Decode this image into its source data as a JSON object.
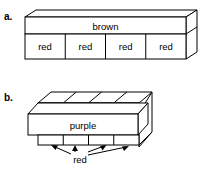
{
  "figure": {
    "background_color": "#ffffff",
    "stroke_color": "#000000",
    "text_color": "#000000",
    "panels": [
      {
        "id": "a",
        "label": "a.",
        "top_face_label": "brown",
        "front_cells": [
          {
            "label": "red"
          },
          {
            "label": "red"
          },
          {
            "label": "red"
          },
          {
            "label": "red"
          }
        ]
      },
      {
        "id": "b",
        "label": "b.",
        "slab_label": "purple",
        "callout_label": "red",
        "top_cubes": 4,
        "bottom_cubes": 4,
        "arrow_count": 4
      }
    ]
  }
}
